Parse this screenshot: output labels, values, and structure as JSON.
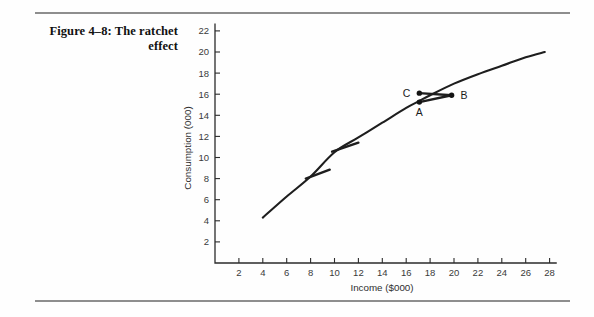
{
  "figure": {
    "title_line1": "Figure 4–8: The ratchet",
    "title_line2": "effect"
  },
  "chart_data": {
    "type": "line",
    "title": "Figure 4–8: The ratchet effect",
    "xlabel": "Income ($000)",
    "ylabel": "Consumption (000)",
    "xlim": [
      0,
      29
    ],
    "ylim": [
      0,
      23
    ],
    "xticks": [
      2,
      4,
      6,
      8,
      10,
      12,
      14,
      16,
      18,
      20,
      22,
      24,
      26,
      28
    ],
    "yticks": [
      2,
      4,
      6,
      8,
      10,
      12,
      14,
      16,
      18,
      20,
      22
    ],
    "grid": false,
    "legend": null,
    "series": [
      {
        "name": "Long-run consumption function",
        "x": [
          4.0,
          6.0,
          8.0,
          10.0,
          12.0,
          14.0,
          16.0,
          17.0,
          18.0,
          20.0,
          22.0,
          24.0,
          26.0,
          27.6
        ],
        "y": [
          4.3,
          6.3,
          8.2,
          10.5,
          11.9,
          13.3,
          14.7,
          15.3,
          15.9,
          17.0,
          17.9,
          18.7,
          19.5,
          20.0
        ]
      }
    ],
    "ratchet_segments": [
      {
        "name": "lower-ratchet",
        "x": [
          7.6,
          9.6
        ],
        "y": [
          8.0,
          8.85
        ]
      },
      {
        "name": "middle-ratchet",
        "x": [
          9.8,
          12.0
        ],
        "y": [
          10.55,
          11.4
        ]
      }
    ],
    "annotated_points": [
      {
        "label": "A",
        "x": 17.1,
        "y": 15.25,
        "label_dx": 0,
        "label_dy": 14,
        "anchor": "middle"
      },
      {
        "label": "B",
        "x": 19.8,
        "y": 15.9,
        "label_dx": 9,
        "label_dy": 4,
        "anchor": "start"
      },
      {
        "label": "C",
        "x": 17.1,
        "y": 16.1,
        "label_dx": -9,
        "label_dy": 4,
        "anchor": "end"
      }
    ],
    "annotation_links": [
      {
        "from": "C",
        "to": "B"
      },
      {
        "from": "A",
        "to": "B"
      }
    ]
  },
  "colors": {
    "curve": "#1e1e1e",
    "axis": "#2b2b2b",
    "rule": "#8e8e8e",
    "text": "#1a1a1a"
  }
}
